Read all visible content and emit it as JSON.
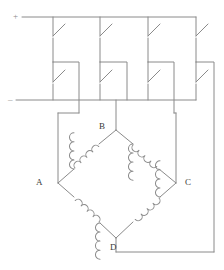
{
  "diagram": {
    "stroke_color": "#8a8a8a",
    "label_color": "#3a3a3a",
    "background": "#ffffff",
    "stroke_width": 1,
    "polarity_markers": [
      {
        "name": "positive-rail-marker",
        "symbol": "+",
        "x": 13,
        "y": 12
      },
      {
        "name": "negative-rail-marker",
        "symbol": "–",
        "x": 8,
        "y": 95
      }
    ],
    "node_labels": [
      {
        "name": "node-label-a",
        "text": "A",
        "x": 36,
        "y": 178
      },
      {
        "name": "node-label-b",
        "text": "B",
        "x": 99,
        "y": 122
      },
      {
        "name": "node-label-c",
        "text": "C",
        "x": 185,
        "y": 178
      },
      {
        "name": "node-label-d",
        "text": "D",
        "x": 110,
        "y": 243
      }
    ],
    "rails": [
      {
        "name": "positive-rail",
        "x1": 22,
        "y1": 17,
        "x2": 196,
        "y2": 17
      },
      {
        "name": "negative-rail",
        "x1": 16,
        "y1": 100,
        "x2": 196,
        "y2": 100
      }
    ],
    "switches_top_row": [
      {
        "name": "switch-top-1",
        "x": 53,
        "y_top": 17,
        "y_bottom": 58
      },
      {
        "name": "switch-top-2",
        "x": 100,
        "y_top": 17,
        "y_bottom": 58
      },
      {
        "name": "switch-top-3",
        "x": 148,
        "y_top": 17,
        "y_bottom": 58
      },
      {
        "name": "switch-top-4",
        "x": 196,
        "y_top": 17,
        "y_bottom": 58
      }
    ],
    "switches_bottom_row": [
      {
        "name": "switch-bottom-1",
        "x": 53,
        "y_top": 62,
        "y_bottom": 100
      },
      {
        "name": "switch-bottom-2",
        "x": 100,
        "y_top": 62,
        "y_bottom": 100
      },
      {
        "name": "switch-bottom-3",
        "x": 148,
        "y_top": 62,
        "y_bottom": 100
      },
      {
        "name": "switch-bottom-4",
        "x": 196,
        "y_top": 62,
        "y_bottom": 100
      }
    ],
    "bridge": {
      "name": "bridge-diamond",
      "vertex_a": {
        "x": 58,
        "y": 183
      },
      "vertex_b": {
        "x": 116,
        "y": 130
      },
      "vertex_c": {
        "x": 176,
        "y": 183
      },
      "vertex_d": {
        "x": 116,
        "y": 238
      },
      "arms": [
        {
          "name": "bridge-arm-ab",
          "from": "A",
          "to": "B",
          "component": "coil"
        },
        {
          "name": "bridge-arm-bc",
          "from": "B",
          "to": "C",
          "component": "coil"
        },
        {
          "name": "bridge-arm-cd",
          "from": "C",
          "to": "D",
          "component": "coil"
        },
        {
          "name": "bridge-arm-da",
          "from": "D",
          "to": "A",
          "component": "coil"
        }
      ]
    },
    "connections": [
      {
        "name": "connection-a-branch",
        "path": "M 53 100 L 53 113 L 79 113 L 79 65"
      },
      {
        "name": "connection-b-branch",
        "path": "M 116 100 L 116 130"
      },
      {
        "name": "connection-c-branch",
        "path": "M 148 100 L 148 113 L 174 113 L 174 65"
      },
      {
        "name": "connection-d-branch",
        "path": "M 196 100 L 214 100 L 214 252 L 116 252"
      }
    ]
  }
}
